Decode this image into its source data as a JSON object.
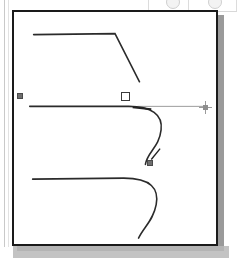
{
  "app": {
    "name": "vector-path-editor",
    "title": "Bezier path editing canvas",
    "active_tool": "pen-tool"
  },
  "toolbar": {
    "visible_fragment": true,
    "separator_x": [
      0,
      40,
      88
    ],
    "buttons": [
      {
        "name": "toolbar-button-1",
        "label": "",
        "x": 18
      },
      {
        "name": "toolbar-button-2",
        "label": "",
        "x": 60
      }
    ]
  },
  "artboard": {
    "label": "Artboard",
    "background_color": "#ffffff",
    "border_color": "#1a1a1a",
    "shadow_color": "#9a9a9a",
    "width": 206,
    "height": 236
  },
  "cursor": {
    "type": "crosshair",
    "label": "Pen tool crosshair",
    "x": 199,
    "y": 101,
    "color": "#9b9b9b"
  },
  "colors": {
    "stroke": "#2b2b2b",
    "handle_line": "#222222",
    "guide_line": "#9a9a9a",
    "anchor_fill": "#6e6e6e",
    "anchor_stroke": "#4a4a4a",
    "selected_anchor_fill": "#ffffff",
    "selected_anchor_stroke": "#3a3a3a",
    "page_border": "#1a1a1a",
    "panel_rule": "#c9c9c9"
  },
  "paths": [
    {
      "name": "top-path",
      "label": "Top open path with corner",
      "d": "M 20 23 L 103 22 L 128 71",
      "stroke": "#2b2b2b",
      "stroke_width": 1.6,
      "fill": "none"
    },
    {
      "name": "active-path",
      "label": "Active S-curve path being drawn",
      "d": "M 16 96 L 117 96 C 140 96 152 104 150 120 C 148 138 136 142 134 155",
      "stroke": "#2b2b2b",
      "stroke_width": 1.6,
      "fill": "none"
    },
    {
      "name": "bottom-path",
      "label": "Bottom open path with hook",
      "d": "M 19 170 L 112 169 C 140 169 148 180 145 196 C 142 212 133 218 127 230",
      "stroke": "#2b2b2b",
      "stroke_width": 1.6,
      "fill": "none"
    }
  ],
  "guides": [
    {
      "name": "direction-guide-line",
      "label": "Direction handle guide extending right",
      "x1": 126,
      "y1": 96,
      "x2": 196,
      "y2": 96,
      "stroke": "#9a9a9a",
      "stroke_width": 1
    },
    {
      "name": "handle-segment-right",
      "label": "Direction handle segment from selected anchor",
      "x1": 121,
      "y1": 97,
      "x2": 140,
      "y2": 99,
      "stroke": "#222222",
      "stroke_width": 2
    },
    {
      "name": "handle-segment-down",
      "label": "Direction handle segment toward lower handle",
      "x1": 140,
      "y1": 150,
      "x2": 149,
      "y2": 139,
      "stroke": "#222222",
      "stroke_width": 1.4
    }
  ],
  "anchors": [
    {
      "name": "anchor-point-start",
      "label": "Start anchor point",
      "type": "solid",
      "x": 17,
      "y": 93,
      "selected": false
    },
    {
      "name": "anchor-point-selected",
      "label": "Selected anchor point",
      "type": "hollow",
      "x": 121,
      "y": 92,
      "selected": true
    },
    {
      "name": "direction-handle-lower",
      "label": "Lower direction handle",
      "type": "solid",
      "x": 147,
      "y": 160,
      "selected": false
    }
  ]
}
